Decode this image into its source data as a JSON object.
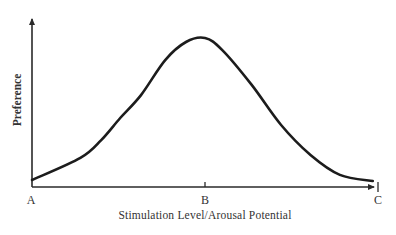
{
  "chart_data": {
    "type": "line",
    "title": "",
    "xlabel": "Stimulation Level/Arousal Potential",
    "ylabel": "Preference",
    "x_ticks": [
      {
        "value": 0,
        "label": "A"
      },
      {
        "value": 1,
        "label": "B"
      },
      {
        "value": 2,
        "label": "C"
      }
    ],
    "xlim": [
      0,
      2
    ],
    "ylim": [
      0,
      1.15
    ],
    "grid": false,
    "legend": "none",
    "series": [
      {
        "name": "Preference curve",
        "x": [
          0,
          0.28,
          0.4,
          0.51,
          0.63,
          0.77,
          0.89,
          1.0,
          1.1,
          1.27,
          1.44,
          1.61,
          1.78,
          1.97
        ],
        "values": [
          0.047,
          0.195,
          0.315,
          0.463,
          0.617,
          0.852,
          0.973,
          1.0,
          0.919,
          0.685,
          0.416,
          0.215,
          0.081,
          0.04
        ]
      }
    ],
    "colors": {
      "curve": "#1c1c1c",
      "axis": "#2a2a2a",
      "text": "#333333"
    }
  }
}
